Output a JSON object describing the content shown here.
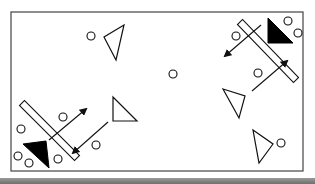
{
  "diagram": {
    "title": "",
    "colors": {
      "background": "#ffffff",
      "stroke": "#111111",
      "fill_dark": "#000000",
      "frame": "#444444",
      "bottom_bar": "#7a7a7a"
    },
    "frame": {
      "x": 11,
      "y": 12,
      "w": 292,
      "h": 159
    },
    "circles": [
      {
        "id": "c-top-left",
        "cx": 91,
        "cy": 36,
        "r": 4
      },
      {
        "id": "c-center",
        "cx": 173,
        "cy": 74,
        "r": 4
      },
      {
        "id": "c-tr-corner-1",
        "cx": 288,
        "cy": 21,
        "r": 4
      },
      {
        "id": "c-tr-corner-2",
        "cx": 298,
        "cy": 33,
        "r": 4
      },
      {
        "id": "c-tr-left",
        "cx": 236,
        "cy": 36,
        "r": 4
      },
      {
        "id": "c-tr-lower",
        "cx": 258,
        "cy": 73,
        "r": 4
      },
      {
        "id": "c-right-bottom",
        "cx": 281,
        "cy": 143,
        "r": 4
      },
      {
        "id": "c-bl-left",
        "cx": 21,
        "cy": 129,
        "r": 4
      },
      {
        "id": "c-bl-corner-1",
        "cx": 18,
        "cy": 156,
        "r": 4
      },
      {
        "id": "c-bl-corner-2",
        "cx": 29,
        "cy": 163,
        "r": 4
      },
      {
        "id": "c-bl-inner",
        "cx": 58,
        "cy": 159,
        "r": 4
      },
      {
        "id": "c-bl-upper",
        "cx": 63,
        "cy": 117,
        "r": 4
      },
      {
        "id": "c-bl-right",
        "cx": 96,
        "cy": 145,
        "r": 4
      }
    ],
    "open_triangles": [
      {
        "id": "t-top-left",
        "points": "124,25 104,37 116,60"
      },
      {
        "id": "t-right-middle",
        "points": "223,89 245,96 239,118"
      },
      {
        "id": "t-right-bottom",
        "points": "253,130 273,144 259,163"
      },
      {
        "id": "t-bottom-middle",
        "points": "113,97 113,121 137,121"
      }
    ],
    "filled_triangles": [
      {
        "id": "ft-top-right",
        "points": "268,18 268,43 293,43"
      },
      {
        "id": "ft-bottom-left",
        "points": "23,144 46,141 49,168"
      }
    ],
    "barriers": [
      {
        "id": "bar-top-right",
        "x1": 240,
        "y1": 22,
        "x2": 296,
        "y2": 80,
        "width": 7
      },
      {
        "id": "bar-bottom-left",
        "x1": 22,
        "y1": 103,
        "x2": 77,
        "y2": 158,
        "width": 7
      }
    ],
    "arrows": [
      {
        "id": "a-tr-down-left",
        "x1": 261,
        "y1": 25,
        "x2": 225,
        "y2": 56
      },
      {
        "id": "a-tr-up-right",
        "x1": 252,
        "y1": 91,
        "x2": 287,
        "y2": 61
      },
      {
        "id": "a-bl-up-right",
        "x1": 49,
        "y1": 140,
        "x2": 86,
        "y2": 109
      },
      {
        "id": "a-bl-down-left",
        "x1": 108,
        "y1": 122,
        "x2": 73,
        "y2": 153
      }
    ]
  }
}
